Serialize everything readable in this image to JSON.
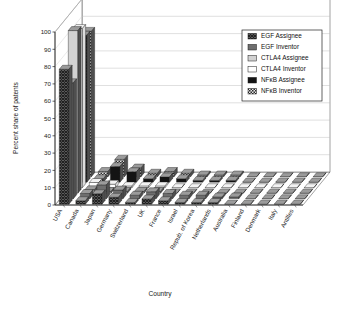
{
  "chart_data": {
    "type": "bar",
    "render": "3d-grouped-bar",
    "title": "",
    "xlabel": "Country",
    "ylabel": "Percent share of patents",
    "ylim": [
      0,
      100
    ],
    "ytick_step": 10,
    "yticks": [
      "0",
      "10",
      "20",
      "30",
      "40",
      "50",
      "60",
      "70",
      "80",
      "90",
      "100"
    ],
    "grid": true,
    "legend_position": "top-right",
    "categories": [
      "USA",
      "Canada",
      "Japan",
      "Germany",
      "Switzerland",
      "UK",
      "France",
      "Israel",
      "Repub. of Korea",
      "Netherlands",
      "Australia",
      "Finland",
      "Denmark",
      "Italy",
      "Antilles"
    ],
    "series": [
      {
        "name": "EGF Assignee",
        "fill": "crosshatch-dark",
        "color": "#4a4a4a",
        "values": [
          78,
          2,
          6,
          4,
          1,
          3,
          2,
          1,
          1,
          1,
          0,
          0,
          0,
          0,
          0
        ]
      },
      {
        "name": "EGF Inventor",
        "fill": "solid-gray",
        "color": "#6e6e6e",
        "values": [
          67,
          3,
          8,
          5,
          2,
          4,
          3,
          2,
          2,
          1,
          1,
          0,
          0,
          0,
          0
        ]
      },
      {
        "name": "CTLA4 Assignee",
        "fill": "light-gray",
        "color": "#cfcfcf",
        "values": [
          94,
          2,
          1,
          1,
          1,
          1,
          0,
          0,
          0,
          0,
          0,
          0,
          0,
          0,
          0
        ]
      },
      {
        "name": "CTLA4 Inventor",
        "fill": "white",
        "color": "#ffffff",
        "values": [
          92,
          3,
          2,
          1,
          1,
          1,
          0,
          0,
          0,
          0,
          0,
          0,
          0,
          0,
          0
        ]
      },
      {
        "name": "NFκB Assignee",
        "fill": "solid-black",
        "color": "#151515",
        "values": [
          85,
          2,
          9,
          6,
          2,
          3,
          2,
          1,
          1,
          1,
          0,
          0,
          0,
          0,
          0
        ]
      },
      {
        "name": "NFκB Inventor",
        "fill": "checker",
        "color": "#555555",
        "values": [
          84,
          3,
          10,
          5,
          2,
          3,
          2,
          1,
          1,
          1,
          0,
          0,
          0,
          0,
          0
        ]
      }
    ]
  }
}
